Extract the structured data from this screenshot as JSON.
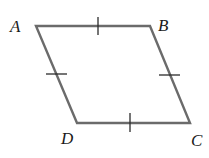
{
  "diagram": {
    "type": "rhombus",
    "edge_color": "#6b6b6b",
    "tick_color": "#2b2b2b",
    "label_color": "#1a1a1a",
    "vertices": [
      {
        "name": "A",
        "x": 36,
        "y": 26,
        "label_x": 10,
        "label_y": 32
      },
      {
        "name": "B",
        "x": 150,
        "y": 26,
        "label_x": 158,
        "label_y": 31
      },
      {
        "name": "C",
        "x": 190,
        "y": 123,
        "label_x": 191,
        "label_y": 146
      },
      {
        "name": "D",
        "x": 77,
        "y": 123,
        "label_x": 61,
        "label_y": 144
      }
    ],
    "edges": [
      {
        "from": "A",
        "to": "B",
        "tick_marks": 1
      },
      {
        "from": "B",
        "to": "C",
        "tick_marks": 1
      },
      {
        "from": "C",
        "to": "D",
        "tick_marks": 1
      },
      {
        "from": "D",
        "to": "A",
        "tick_marks": 1
      }
    ],
    "ticks": [
      {
        "edge": "AB",
        "x1": 98,
        "y1": 17,
        "x2": 98,
        "y2": 35
      },
      {
        "edge": "AD",
        "x1": 46,
        "y1": 74,
        "x2": 67,
        "y2": 74
      },
      {
        "edge": "BC",
        "x1": 159,
        "y1": 75,
        "x2": 180,
        "y2": 75
      },
      {
        "edge": "DC",
        "x1": 130,
        "y1": 113,
        "x2": 130,
        "y2": 132
      }
    ]
  }
}
